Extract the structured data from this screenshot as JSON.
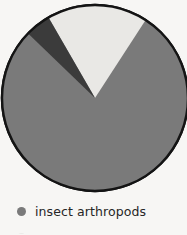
{
  "figure": {
    "background_color": "#f7f6f4",
    "outline_color": "#141414"
  },
  "chart_data": {
    "type": "pie",
    "title": "",
    "subtitle": "",
    "xlabel": "",
    "ylabel": "",
    "grid": false,
    "legend_position": "bottom-left",
    "start_angle_deg": 33,
    "direction": "clockwise",
    "categories": [
      "insect arthropods",
      "other arthropods",
      "non-arthropods"
    ],
    "values": [
      78,
      16,
      6
    ],
    "units": "percent",
    "colors": [
      "#7a7a7a",
      "#e9e8e5",
      "#3b3b3b"
    ],
    "slices": [
      {
        "label": "insect arthropods",
        "value": 78,
        "color": "#7a7a7a",
        "start_angle_deg": 33,
        "end_angle_deg": 314
      },
      {
        "label": "other arthropods",
        "value": 16,
        "color": "#e9e8e5",
        "start_angle_deg": 330,
        "end_angle_deg": 33
      },
      {
        "label": "non-arthropods",
        "value": 6,
        "color": "#3b3b3b",
        "start_angle_deg": 314,
        "end_angle_deg": 330
      }
    ]
  },
  "pie": {
    "center_x": 95,
    "center_y": 98,
    "radius": 93,
    "stroke_width": 2.4
  },
  "legend": {
    "items": [
      {
        "label": "insect arthropods",
        "color": "#7a7a7a",
        "visible": true
      },
      {
        "label": "",
        "color": "#e9e8e5",
        "visible": false
      }
    ]
  }
}
